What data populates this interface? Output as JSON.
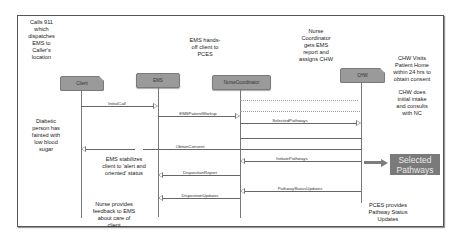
{
  "diagram": {
    "type": "sequence-diagram",
    "lifelines": [
      {
        "id": "client",
        "label": "Client"
      },
      {
        "id": "ems",
        "label": "EMS"
      },
      {
        "id": "nurse",
        "label": "NurseCoordinator"
      },
      {
        "id": "chw",
        "label": "CHW"
      }
    ],
    "messages": [
      {
        "label": "InitialCall",
        "from": "Client",
        "to": "EMS"
      },
      {
        "label": "EMSPatientWorkup",
        "from": "EMS",
        "to": "NurseCoordinator"
      },
      {
        "label": "SelectedPathways",
        "from": "NurseCoordinator",
        "to": "CHW"
      },
      {
        "label": "ObtainConsent",
        "from": "CHW",
        "to": "Client"
      },
      {
        "label": "InitiatePathways",
        "from": "CHW",
        "to": "NurseCoordinator"
      },
      {
        "label": "DispositionReport",
        "from": "NurseCoordinator",
        "to": "EMS"
      },
      {
        "label": "PathwayStatusUpdates",
        "from": "CHW",
        "to": "NurseCoordinator"
      },
      {
        "label": "DispositionUpdates",
        "from": "NurseCoordinator",
        "to": "EMS"
      }
    ],
    "notes": {
      "calls_911": "Calls 911 which dispatches EMS to Caller's location",
      "ems_handoff": "EMS hands-off client to PCES",
      "nurse_gets_report": "Nurse Coordinator gets EMS report and assigns CHW",
      "chw_visits": "CHW Visits Patient Home within 24 hrs to obtain consent",
      "chw_intake": "CHW does initial intake and consults with NC",
      "diabetic": "Diabetic person has fainted with low blood sugar",
      "ems_stabilizes": "EMS stabilizes client to 'alert and oriented' status",
      "nurse_feedback": "Nurse provides feedback to EMS about care of client",
      "pces_updates": "PCES provides Pathway Status Updates"
    },
    "callout": {
      "label": "Selected Pathways",
      "color": "#7a7a7a"
    }
  }
}
